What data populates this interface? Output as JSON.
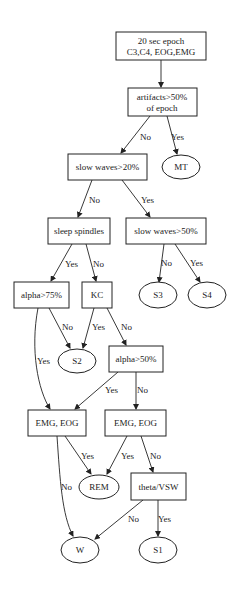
{
  "diagram": {
    "type": "decision-tree",
    "nodes": {
      "epoch": {
        "lines": [
          "20 sec epoch",
          "C3,C4, EOG,EMG"
        ]
      },
      "artifacts": {
        "lines": [
          "artifacts>50%",
          "of epoch"
        ]
      },
      "mt": {
        "label": "MT"
      },
      "sw20": {
        "label": "slow waves>20%"
      },
      "spindles": {
        "label": "sleep spindles"
      },
      "sw50": {
        "label": "slow waves>50%"
      },
      "alpha75": {
        "label": "alpha>75%"
      },
      "kc": {
        "label": "KC"
      },
      "s3": {
        "label": "S3"
      },
      "s4": {
        "label": "S4"
      },
      "s2": {
        "label": "S2"
      },
      "alpha50": {
        "label": "alpha>50%"
      },
      "emgeog1": {
        "label": "EMG, EOG"
      },
      "emgeog2": {
        "label": "EMG, EOG"
      },
      "rem": {
        "label": "REM"
      },
      "theta": {
        "label": "theta/VSW"
      },
      "w": {
        "label": "W"
      },
      "s1": {
        "label": "S1"
      }
    },
    "edges": {
      "artifacts_no": "No",
      "artifacts_yes": "Yes",
      "sw20_no": "No",
      "sw20_yes": "Yes",
      "spindles_yes": "Yes",
      "spindles_no": "No",
      "sw50_no": "No",
      "sw50_yes": "Yes",
      "alpha75_yes": "Yes",
      "alpha75_no": "No",
      "kc_yes": "Yes",
      "kc_no": "No",
      "alpha50_yes": "Yes",
      "alpha50_no": "No",
      "emgeog1_yes": "Yes",
      "emgeog1_no": "No",
      "emgeog2_yes": "Yes",
      "emgeog2_no": "No",
      "theta_no": "No",
      "theta_yes": "Yes"
    }
  }
}
